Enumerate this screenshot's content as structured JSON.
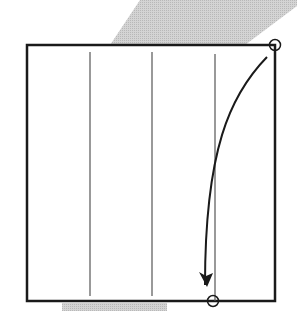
{
  "diagram": {
    "type": "origami-fold-step",
    "description": "Square paper with three vertical crease lines; fold the top-right corner down to the bottom edge where it meets the rightmost crease",
    "canvas": {
      "width": 297,
      "height": 311
    },
    "colors": {
      "background": "#ffffff",
      "paper_outline": "#1a1a1a",
      "crease": "#555555",
      "arrow": "#1a1a1a",
      "shadow": "#c8c8c8"
    },
    "square": {
      "x1": 27,
      "y1": 45,
      "x2": 275,
      "y2": 301
    },
    "creases": [
      {
        "x": 90,
        "y1": 52,
        "y2": 296
      },
      {
        "x": 152,
        "y1": 52,
        "y2": 296
      },
      {
        "x": 215,
        "y1": 54,
        "y2": 301
      }
    ],
    "markers": [
      {
        "name": "start-point",
        "cx": 275,
        "cy": 45,
        "r": 5.5
      },
      {
        "name": "target-point",
        "cx": 213,
        "cy": 301,
        "r": 5.5
      }
    ],
    "fold_arrow": {
      "path": "M 267 57 C 230 95, 205 150, 205 285",
      "head": {
        "tip_x": 207,
        "tip_y": 287
      }
    },
    "shadows": [
      {
        "name": "top-shadow",
        "points": "110,45 140,0 297,0 297,6 245,45"
      },
      {
        "name": "bottom-shadow",
        "points": "62,303 167,303 167,311 62,311"
      }
    ]
  }
}
